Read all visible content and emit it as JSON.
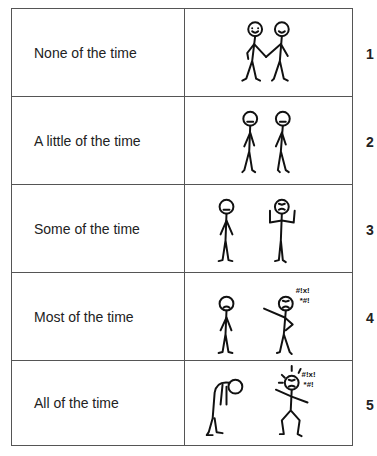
{
  "scale": {
    "rows": [
      {
        "label": "None of the time",
        "score": "1",
        "illustration": "two-smiling-figures-holding-hands-icon"
      },
      {
        "label": "A little of the time",
        "score": "2",
        "illustration": "two-neutral-figures-icon"
      },
      {
        "label": "Some of the time",
        "score": "3",
        "illustration": "neutral-and-frustrated-figure-icon"
      },
      {
        "label": "Most of the time",
        "score": "4",
        "illustration": "sad-and-angry-pointing-figure-icon",
        "exclamation": [
          "#!x!",
          "*#!"
        ]
      },
      {
        "label": "All of the time",
        "score": "5",
        "illustration": "slumped-and-furious-figure-icon",
        "exclamation": [
          "#!x!",
          "*#!"
        ]
      }
    ]
  }
}
